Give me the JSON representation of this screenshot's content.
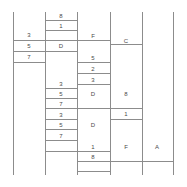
{
  "diagram": {
    "type": "ladder-grid-diagram",
    "width": 187,
    "height": 187,
    "line_color": "#8c8c8c",
    "text_color": "#4a4a4a",
    "background_color": "#ffffff",
    "columns": [
      {
        "id": "col-1",
        "x_left": 13,
        "x_right": 45
      },
      {
        "id": "col-2",
        "x_left": 45,
        "x_right": 77
      },
      {
        "id": "col-3",
        "x_left": 77,
        "x_right": 110
      },
      {
        "id": "col-4",
        "x_left": 110,
        "x_right": 142
      },
      {
        "id": "col-5",
        "x_left": 142,
        "x_right": 173
      },
      {
        "id": "col-6",
        "x_left": 173,
        "x_right": 173
      }
    ],
    "verticals": [
      {
        "x": 13,
        "y_top": 12,
        "y_bottom": 175
      },
      {
        "x": 45,
        "y_top": 12,
        "y_bottom": 175
      },
      {
        "x": 77,
        "y_top": 12,
        "y_bottom": 175
      },
      {
        "x": 110,
        "y_top": 12,
        "y_bottom": 175
      },
      {
        "x": 142,
        "y_top": 12,
        "y_bottom": 175
      },
      {
        "x": 173,
        "y_top": 12,
        "y_bottom": 175
      }
    ],
    "rungs": [
      {
        "x_start": 45,
        "x_end": 77,
        "y": 20
      },
      {
        "x_start": 45,
        "x_end": 77,
        "y": 30
      },
      {
        "x_start": 13,
        "x_end": 45,
        "y": 40
      },
      {
        "x_start": 45,
        "x_end": 110,
        "y": 40
      },
      {
        "x_start": 13,
        "x_end": 77,
        "y": 51
      },
      {
        "x_start": 110,
        "x_end": 142,
        "y": 44
      },
      {
        "x_start": 13,
        "x_end": 45,
        "y": 62
      },
      {
        "x_start": 77,
        "x_end": 110,
        "y": 62
      },
      {
        "x_start": 77,
        "x_end": 110,
        "y": 73
      },
      {
        "x_start": 77,
        "x_end": 110,
        "y": 84
      },
      {
        "x_start": 45,
        "x_end": 77,
        "y": 88
      },
      {
        "x_start": 45,
        "x_end": 77,
        "y": 98
      },
      {
        "x_start": 45,
        "x_end": 142,
        "y": 108
      },
      {
        "x_start": 45,
        "x_end": 77,
        "y": 119
      },
      {
        "x_start": 110,
        "x_end": 142,
        "y": 119
      },
      {
        "x_start": 45,
        "x_end": 77,
        "y": 129
      },
      {
        "x_start": 45,
        "x_end": 77,
        "y": 140
      },
      {
        "x_start": 45,
        "x_end": 110,
        "y": 151
      },
      {
        "x_start": 77,
        "x_end": 173,
        "y": 161
      },
      {
        "x_start": 77,
        "x_end": 110,
        "y": 171
      }
    ],
    "labels": [
      {
        "id": "lbl-c2-8",
        "text": "8",
        "x": 61,
        "y": 16
      },
      {
        "id": "lbl-c2-1",
        "text": "1",
        "x": 61,
        "y": 26
      },
      {
        "id": "lbl-c1-3",
        "text": "3",
        "x": 29,
        "y": 35
      },
      {
        "id": "lbl-c3-F",
        "text": "F",
        "x": 93,
        "y": 36
      },
      {
        "id": "lbl-c1-5",
        "text": "5",
        "x": 29,
        "y": 46
      },
      {
        "id": "lbl-c2-D",
        "text": "D",
        "x": 61,
        "y": 46
      },
      {
        "id": "lbl-c4-C",
        "text": "C",
        "x": 126,
        "y": 41
      },
      {
        "id": "lbl-c1-7",
        "text": "7",
        "x": 29,
        "y": 57
      },
      {
        "id": "lbl-c3-5",
        "text": "5",
        "x": 93,
        "y": 58
      },
      {
        "id": "lbl-c3-2",
        "text": "2",
        "x": 93,
        "y": 69
      },
      {
        "id": "lbl-c3-3",
        "text": "3",
        "x": 93,
        "y": 80
      },
      {
        "id": "lbl-c2-3a",
        "text": "3",
        "x": 61,
        "y": 84
      },
      {
        "id": "lbl-c2-5a",
        "text": "5",
        "x": 61,
        "y": 94
      },
      {
        "id": "lbl-c3-Da",
        "text": "D",
        "x": 93,
        "y": 94
      },
      {
        "id": "lbl-c4-8",
        "text": "8",
        "x": 126,
        "y": 94
      },
      {
        "id": "lbl-c2-7a",
        "text": "7",
        "x": 61,
        "y": 104
      },
      {
        "id": "lbl-c2-3b",
        "text": "3",
        "x": 61,
        "y": 115
      },
      {
        "id": "lbl-c4-1",
        "text": "1",
        "x": 126,
        "y": 114
      },
      {
        "id": "lbl-c2-5b",
        "text": "5",
        "x": 61,
        "y": 125
      },
      {
        "id": "lbl-c3-Db",
        "text": "D",
        "x": 93,
        "y": 125
      },
      {
        "id": "lbl-c2-7b",
        "text": "7",
        "x": 61,
        "y": 136
      },
      {
        "id": "lbl-c3-1",
        "text": "1",
        "x": 93,
        "y": 147
      },
      {
        "id": "lbl-c4-F",
        "text": "F",
        "x": 126,
        "y": 147
      },
      {
        "id": "lbl-c5-A",
        "text": "A",
        "x": 157,
        "y": 147
      },
      {
        "id": "lbl-c3-8",
        "text": "8",
        "x": 93,
        "y": 157
      }
    ]
  }
}
